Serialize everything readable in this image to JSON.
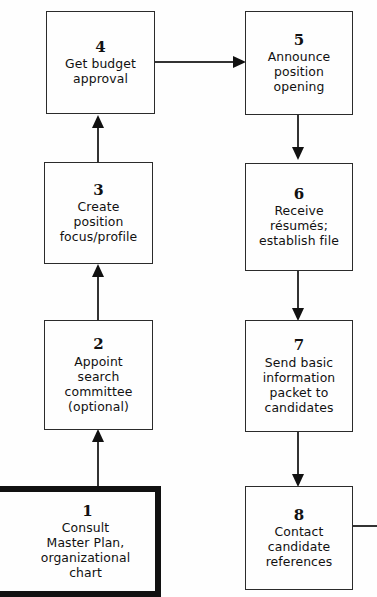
{
  "diagram": {
    "accent_color": "#111111",
    "box_border_color": "#2b2b2b",
    "background_color": "#fefefe",
    "nodes": [
      {
        "id": "node-4",
        "number": "4",
        "label": "Get budget\napproval",
        "emphasis": false
      },
      {
        "id": "node-5",
        "number": "5",
        "label": "Announce\nposition\nopening",
        "emphasis": false
      },
      {
        "id": "node-3",
        "number": "3",
        "label": "Create\nposition\nfocus/profile",
        "emphasis": false
      },
      {
        "id": "node-6",
        "number": "6",
        "label": "Receive\nrésumés;\nestablish file",
        "emphasis": false
      },
      {
        "id": "node-2",
        "number": "2",
        "label": "Appoint\nsearch\ncommittee\n(optional)",
        "emphasis": false
      },
      {
        "id": "node-7",
        "number": "7",
        "label": "Send basic\ninformation\npacket to\ncandidates",
        "emphasis": false
      },
      {
        "id": "node-1",
        "number": "1",
        "label": "Consult\nMaster Plan,\norganizational\nchart",
        "emphasis": true
      },
      {
        "id": "node-8",
        "number": "8",
        "label": "Contact\ncandidate\nreferences",
        "emphasis": false
      }
    ],
    "connectors": [
      {
        "from": "node-1",
        "to": "node-2",
        "direction": "up"
      },
      {
        "from": "node-2",
        "to": "node-3",
        "direction": "up"
      },
      {
        "from": "node-3",
        "to": "node-4",
        "direction": "up"
      },
      {
        "from": "node-4",
        "to": "node-5",
        "direction": "right"
      },
      {
        "from": "node-5",
        "to": "node-6",
        "direction": "down"
      },
      {
        "from": "node-6",
        "to": "node-7",
        "direction": "down"
      },
      {
        "from": "node-7",
        "to": "node-8",
        "direction": "down"
      },
      {
        "from": "entry",
        "to": "node-1",
        "direction": "right"
      },
      {
        "from": "node-8",
        "to": "offpage",
        "direction": "right"
      }
    ]
  }
}
